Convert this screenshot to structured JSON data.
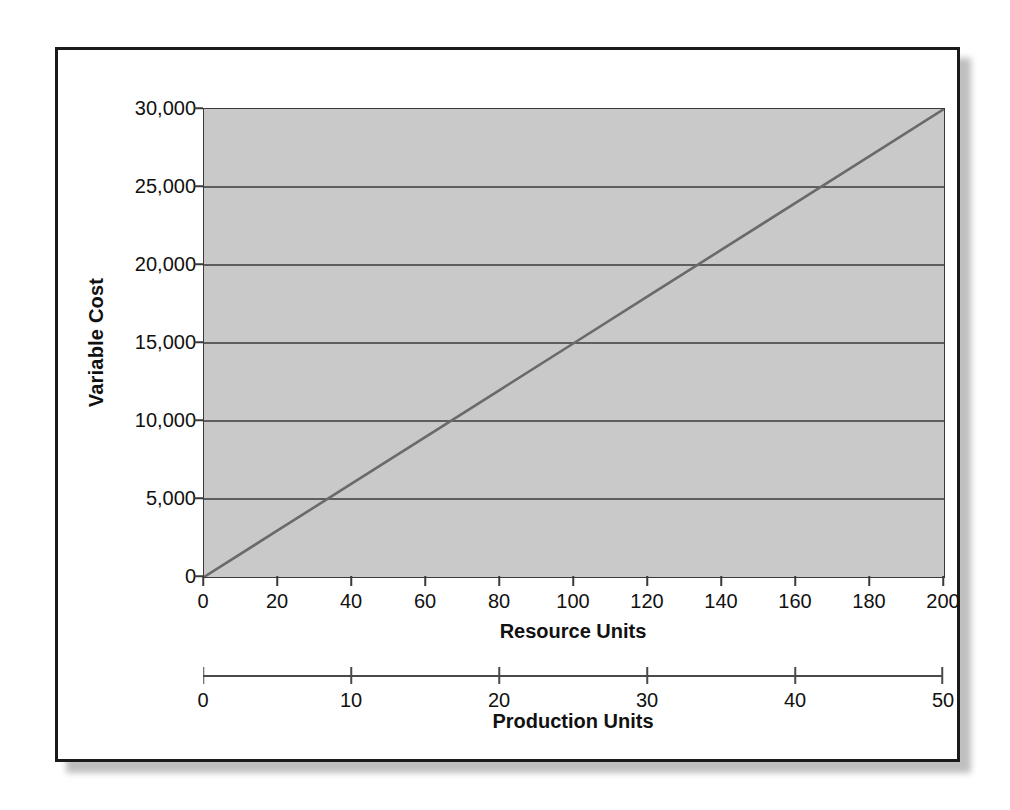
{
  "chart_data": {
    "type": "line",
    "title": "",
    "subtitle": "",
    "xlabel": "Resource Units",
    "ylabel": "Variable Cost",
    "secondary_xlabel": "Production Units",
    "xlim": [
      0,
      200
    ],
    "ylim": [
      0,
      30000
    ],
    "secondary_xlim": [
      0,
      50
    ],
    "grid": true,
    "grid_axis": "y",
    "legend": "none",
    "plot_background": "#c9c9c9",
    "line_color": "#6a6a6a",
    "gridline_color": "#3a3a3a",
    "x_tick_labels": [
      "0",
      "20",
      "40",
      "60",
      "80",
      "100",
      "120",
      "140",
      "160",
      "180",
      "200"
    ],
    "x_tick_values": [
      0,
      20,
      40,
      60,
      80,
      100,
      120,
      140,
      160,
      180,
      200
    ],
    "y_tick_labels": [
      "0",
      "5,000",
      "10,000",
      "15,000",
      "20,000",
      "25,000",
      "30,000"
    ],
    "y_tick_values": [
      0,
      5000,
      10000,
      15000,
      20000,
      25000,
      30000
    ],
    "secondary_x_tick_labels": [
      "0",
      "10",
      "20",
      "30",
      "40",
      "50"
    ],
    "secondary_x_tick_values": [
      0,
      10,
      20,
      30,
      40,
      50
    ],
    "series": [
      {
        "name": "Variable Cost",
        "x": [
          0,
          20,
          40,
          60,
          80,
          100,
          120,
          140,
          160,
          180,
          200
        ],
        "values": [
          0,
          3000,
          6000,
          9000,
          12000,
          15000,
          18000,
          21000,
          24000,
          27000,
          30000
        ]
      }
    ],
    "annotations": []
  }
}
